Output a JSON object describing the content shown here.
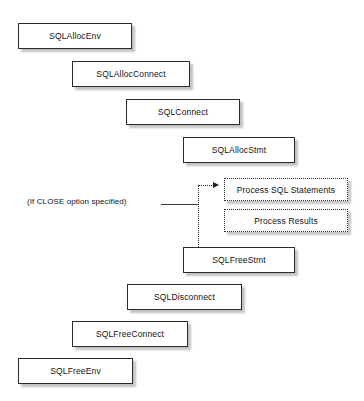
{
  "diagram": {
    "background_color": "#ffffff",
    "box_border_color": "#2b2b2b",
    "text_color": "#111111",
    "nodes": [
      {
        "id": "alloc-env",
        "label": "SQLAllocEnv",
        "x": 18,
        "y": 23,
        "w": 114,
        "h": 26
      },
      {
        "id": "alloc-connect",
        "label": "SQLAllocConnect",
        "x": 72,
        "y": 61,
        "w": 118,
        "h": 26
      },
      {
        "id": "connect",
        "label": "SQLConnect",
        "x": 126,
        "y": 99,
        "w": 114,
        "h": 26
      },
      {
        "id": "alloc-stmt",
        "label": "SQLAllocStmt",
        "x": 183,
        "y": 137,
        "w": 112,
        "h": 26
      },
      {
        "id": "free-stmt",
        "label": "SQLFreeStmt",
        "x": 183,
        "y": 247,
        "w": 112,
        "h": 26
      },
      {
        "id": "disconnect",
        "label": "SQLDisconnect",
        "x": 127,
        "y": 284,
        "w": 115,
        "h": 26
      },
      {
        "id": "free-connect",
        "label": "SQLFreeConnect",
        "x": 72,
        "y": 321,
        "w": 116,
        "h": 26
      },
      {
        "id": "free-env",
        "label": "SQLFreeEnv",
        "x": 18,
        "y": 358,
        "w": 115,
        "h": 26
      }
    ],
    "dotted_nodes": [
      {
        "id": "process-sql-statements",
        "label": "Process SQL Statements",
        "x": 224,
        "y": 178,
        "w": 124,
        "h": 23
      },
      {
        "id": "process-results",
        "label": "Process Results",
        "x": 224,
        "y": 209,
        "w": 124,
        "h": 23
      }
    ],
    "annotations": [
      {
        "id": "close-option-note",
        "label": "(If CLOSE option specified)",
        "x": 27,
        "y": 197
      }
    ],
    "connectors": [
      {
        "id": "close-option-line",
        "type": "solid-horizontal",
        "x": 161,
        "y": 204,
        "length": 37
      },
      {
        "id": "free-stmt-riser",
        "type": "dotted-vertical",
        "x": 198,
        "y": 185,
        "length": 62
      },
      {
        "id": "arrow-run",
        "type": "dotted-horizontal",
        "x": 198,
        "y": 185,
        "length": 18
      }
    ],
    "arrow_heads": [
      {
        "id": "process-sql-arrow",
        "x": 213,
        "y": 186
      }
    ]
  }
}
